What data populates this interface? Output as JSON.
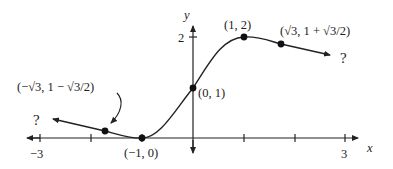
{
  "axes": {
    "x_label": "x",
    "y_label": "y",
    "x_ticks": [
      "−3",
      "3"
    ],
    "y_ticks": [
      "2"
    ]
  },
  "points": [
    {
      "label": "(−√3, 1 − √3/2)",
      "x": -1.732,
      "y": 0.134
    },
    {
      "label": "(−1, 0)",
      "x": -1,
      "y": 0
    },
    {
      "label": "(0, 1)",
      "x": 0,
      "y": 1
    },
    {
      "label": "(1, 2)",
      "x": 1,
      "y": 2
    },
    {
      "label": "(√3, 1 + √3/2)",
      "x": 1.732,
      "y": 1.866
    }
  ],
  "annotations": {
    "left_question": "?",
    "right_question": "?"
  },
  "colors": {
    "ink": "#222222",
    "background": "#ffffff"
  }
}
